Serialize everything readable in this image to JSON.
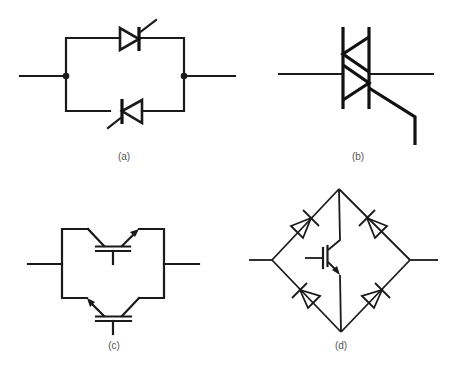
{
  "figure": {
    "panels": [
      {
        "id": "a",
        "label": "(a)",
        "description": "Two thyristors (SCRs) in inverse-parallel (anti-parallel) connection"
      },
      {
        "id": "b",
        "label": "(b)",
        "description": "Triac symbol (bidirectional thyristor) with gate lead"
      },
      {
        "id": "c",
        "label": "(c)",
        "description": "Two IGBTs in inverse-parallel connection"
      },
      {
        "id": "d",
        "label": "(d)",
        "description": "Single IGBT inside a four-diode bridge forming a bidirectional switch"
      }
    ]
  }
}
